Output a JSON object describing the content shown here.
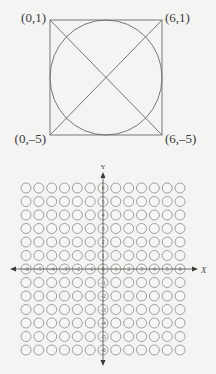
{
  "figure_top": {
    "title": "",
    "corner_labels": {
      "top_left": "(0,1)",
      "top_right": "(6,1)",
      "bottom_left": "(0,–5)",
      "bottom_right": "(6,–5)"
    },
    "shapes": [
      "square",
      "inscribed-circle",
      "diagonal-1",
      "diagonal-2"
    ]
  },
  "figure_bottom": {
    "x_axis_label": "X",
    "y_axis_label": "Y",
    "x_axis_values": [
      "-6",
      "-5",
      "-4",
      "-3",
      "-2",
      "-1",
      "0",
      "1",
      "2",
      "3",
      "4",
      "5",
      "6"
    ],
    "y_axis_values": [
      "6",
      "5",
      "4",
      "3",
      "2",
      "1",
      "0",
      "-1",
      "-2",
      "-3",
      "-4",
      "-5",
      "-6"
    ],
    "grid_columns": 13,
    "grid_rows": 13
  },
  "colors": {
    "ink": "#5a5a5a",
    "bubble_stroke": "#8a8a8a",
    "background": "#f4f4f2"
  }
}
